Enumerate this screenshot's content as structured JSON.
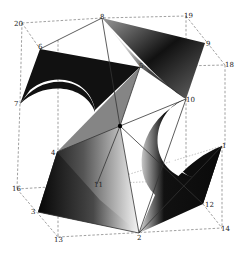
{
  "figure": {
    "title": "",
    "colors": {
      "surface_dark": "#111111",
      "surface_light": "#f2f2f2",
      "edge": "#333333",
      "dashed": "#777777",
      "background": "#ffffff"
    },
    "labels": [
      {
        "id": "20",
        "text": "20",
        "x": 14,
        "y": 26
      },
      {
        "id": "8",
        "text": "8",
        "x": 100,
        "y": 19
      },
      {
        "id": "19",
        "text": "19",
        "x": 184,
        "y": 18
      },
      {
        "id": "9",
        "text": "9",
        "x": 206,
        "y": 46
      },
      {
        "id": "18",
        "text": "18",
        "x": 225,
        "y": 67
      },
      {
        "id": "6",
        "text": "6",
        "x": 38,
        "y": 49
      },
      {
        "id": "5",
        "text": "5",
        "x": 139,
        "y": 68
      },
      {
        "id": "7",
        "text": "7",
        "x": 14,
        "y": 106
      },
      {
        "id": "10",
        "text": "10",
        "x": 186,
        "y": 102
      },
      {
        "id": "4",
        "text": "4",
        "x": 51,
        "y": 155
      },
      {
        "id": "1",
        "text": "1",
        "x": 222,
        "y": 148
      },
      {
        "id": "11",
        "text": "11",
        "x": 94,
        "y": 187
      },
      {
        "id": "16",
        "text": "16",
        "x": 12,
        "y": 191
      },
      {
        "id": "12",
        "text": "12",
        "x": 205,
        "y": 207
      },
      {
        "id": "3",
        "text": "3",
        "x": 31,
        "y": 214
      },
      {
        "id": "14",
        "text": "14",
        "x": 221,
        "y": 231
      },
      {
        "id": "2",
        "text": "2",
        "x": 137,
        "y": 240
      },
      {
        "id": "13",
        "text": "13",
        "x": 54,
        "y": 242
      }
    ]
  }
}
